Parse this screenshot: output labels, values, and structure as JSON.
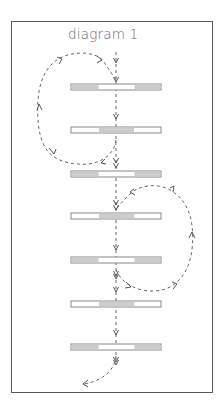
{
  "title": "diagram 1",
  "colors": {
    "frame": "#5a5a5a",
    "bar_fill": "#ffffff",
    "bar_shaded": "#cccccc",
    "bar_border": "#888888",
    "arrow": "#555555"
  },
  "bars": [
    {
      "index": 1,
      "y": 84,
      "pattern": "ends-shaded"
    },
    {
      "index": 2,
      "y": 127,
      "pattern": "middle-shaded"
    },
    {
      "index": 3,
      "y": 171,
      "pattern": "ends-shaded"
    },
    {
      "index": 4,
      "y": 213,
      "pattern": "middle-shaded"
    },
    {
      "index": 5,
      "y": 257,
      "pattern": "ends-shaded"
    },
    {
      "index": 6,
      "y": 301,
      "pattern": "middle-shaded"
    },
    {
      "index": 7,
      "y": 344,
      "pattern": "ends-shaded"
    }
  ],
  "loops": [
    {
      "name": "left-loop",
      "from_bar": 2,
      "to_bar": 1,
      "side": "left"
    },
    {
      "name": "right-loop",
      "from_bar": 5,
      "to_bar": 4,
      "side": "right"
    }
  ],
  "exit_arrow": {
    "from_bar": 7,
    "direction": "down-left"
  }
}
